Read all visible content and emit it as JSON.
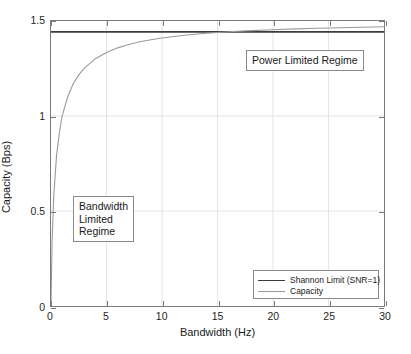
{
  "chart_data": {
    "type": "line",
    "title": "",
    "xlabel": "Bandwidth (Hz)",
    "ylabel": "Capacity (Bps)",
    "xlim": [
      0,
      30
    ],
    "ylim": [
      0,
      1.5
    ],
    "xticks": [
      0,
      5,
      10,
      15,
      20,
      25,
      30
    ],
    "xticklabels": [
      "0",
      "5",
      "10",
      "15",
      "20",
      "25",
      "30"
    ],
    "yticks": [
      0,
      0.5,
      1,
      1.5
    ],
    "yticklabels": [
      "0",
      "0.5",
      "1",
      "1.5"
    ],
    "grid": true,
    "legend_position": "lower right",
    "series": [
      {
        "name": "Shannon Limit (SNR=1)",
        "color": "#3d3d3d",
        "type": "horizontal-line",
        "value": 1.4427,
        "x": [
          0,
          30
        ],
        "values": [
          1.4427,
          1.4427
        ]
      },
      {
        "name": "Capacity",
        "color": "#9a9a9a",
        "type": "curve",
        "formula": "C = B*log2(1 + 1/B)",
        "x": [
          0,
          0.1,
          0.25,
          0.5,
          0.75,
          1,
          1.5,
          2,
          2.5,
          3,
          4,
          5,
          6,
          7,
          8,
          9,
          10,
          12,
          14,
          16,
          18,
          20,
          22,
          24,
          26,
          28,
          30
        ],
        "values": [
          0,
          0.3459,
          0.5799,
          0.7925,
          0.9093,
          1.0,
          1.0999,
          1.1699,
          1.2163,
          1.2516,
          1.3016,
          1.3347,
          1.3586,
          1.3765,
          1.3905,
          1.4017,
          1.4109,
          1.425,
          1.4353,
          1.4431,
          1.4493,
          1.4542,
          1.4583,
          1.4618,
          1.4647,
          1.4672,
          1.4695
        ]
      }
    ],
    "annotations": [
      {
        "name": "power-limited-regime",
        "lines": [
          "Power Limited Regime"
        ],
        "x": 17.5,
        "y": 1.33
      },
      {
        "name": "bandwidth-limited-regime",
        "lines": [
          "Bandwidth",
          "Limited",
          "Regime"
        ],
        "x": 2.0,
        "y": 0.58
      }
    ]
  }
}
